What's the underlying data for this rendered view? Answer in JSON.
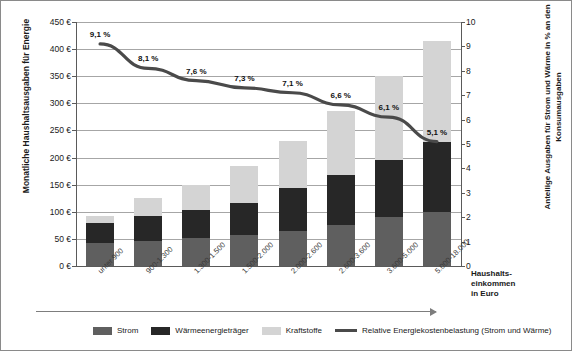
{
  "chart_data": {
    "type": "bar",
    "title": "",
    "subtitle": "",
    "xlabel": "Haushalts-\neinkommen\nin Euro",
    "ylabel": "Monatliche Haushaltsausgaben für Energie",
    "ylabel_right": "Anteilige Ausgaben für Strom und Wärme in % an den Konsumausgaben",
    "ylim": [
      0,
      450
    ],
    "ylim_right": [
      0,
      10
    ],
    "grid": true,
    "legend_position": "bottom",
    "categories": [
      "unter 900",
      "900-1.300",
      "1.300-1.500",
      "1.500-2.000",
      "2.000-2.600",
      "2.600-3.600",
      "3.600-5.000",
      "5.000-18.000"
    ],
    "series": [
      {
        "name": "Strom",
        "color": "#5f5f5f",
        "values": [
          42,
          46,
          52,
          58,
          65,
          75,
          90,
          100
        ]
      },
      {
        "name": "Wärmeenergieträger",
        "color": "#272727",
        "values": [
          38,
          47,
          52,
          58,
          78,
          92,
          106,
          128
        ]
      },
      {
        "name": "Kraftstoffe",
        "color": "#d4d4d4",
        "values": [
          13,
          33,
          46,
          69,
          87,
          118,
          154,
          187
        ]
      }
    ],
    "stacked_totals": [
      93,
      126,
      150,
      185,
      230,
      285,
      350,
      415
    ],
    "line_series": {
      "name": "Relative Energiekostenbelastung (Strom und Wärme)",
      "color": "#4a4a4a",
      "axis": "right",
      "values": [
        9.1,
        8.1,
        7.6,
        7.3,
        7.1,
        6.6,
        6.1,
        5.1
      ],
      "labels": [
        "9,1 %",
        "8,1 %",
        "7,6 %",
        "7,3 %",
        "7,1 %",
        "6,6 %",
        "6,1 %",
        "5,1 %"
      ]
    },
    "yticks_left": [
      "0 €",
      "50 €",
      "100 €",
      "150 €",
      "200 €",
      "250 €",
      "300 €",
      "350 €",
      "400 €",
      "450 €"
    ],
    "ytick_values_left": [
      0,
      50,
      100,
      150,
      200,
      250,
      300,
      350,
      400,
      450
    ],
    "yticks_right": [
      "0",
      "1",
      "2",
      "3",
      "4",
      "5",
      "6",
      "7",
      "8",
      "9",
      "10"
    ],
    "ytick_values_right": [
      0,
      1,
      2,
      3,
      4,
      5,
      6,
      7,
      8,
      9,
      10
    ]
  },
  "axes": {
    "left_title": "Monatliche Haushaltsausgaben für Energie",
    "right_title": "Anteilige Ausgaben für Strom und Wärme in % an den Konsumausgaben",
    "bottom_title_line1": "Haushalts-",
    "bottom_title_line2": "einkommen",
    "bottom_title_line3": "in Euro"
  },
  "legend": {
    "items": [
      {
        "label": "Strom",
        "type": "swatch",
        "color": "#5f5f5f"
      },
      {
        "label": "Wärmeenergieträger",
        "type": "swatch",
        "color": "#272727"
      },
      {
        "label": "Kraftstoffe",
        "type": "swatch",
        "color": "#d4d4d4"
      },
      {
        "label": "Relative Energiekostenbelastung (Strom und Wärme)",
        "type": "line",
        "color": "#4a4a4a"
      }
    ]
  }
}
